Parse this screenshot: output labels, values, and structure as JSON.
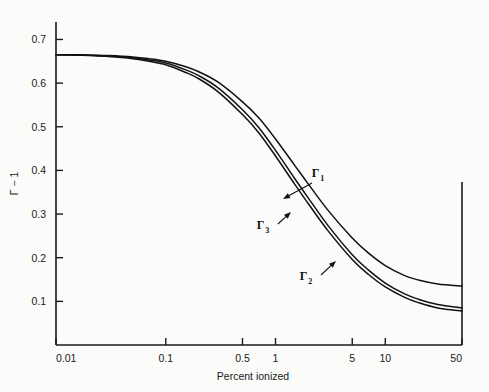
{
  "chart_data": {
    "type": "line",
    "title": "",
    "xlabel": "Percent ionized",
    "ylabel": "Γ − 1",
    "xscale": "log",
    "yscale": "linear",
    "xlim": [
      0.01,
      50
    ],
    "ylim": [
      0.0,
      0.74
    ],
    "grid": false,
    "legend_position": "inline-annotations",
    "xticks": [
      {
        "value": 0.01,
        "label": "0.01"
      },
      {
        "value": 0.1,
        "label": "0.1"
      },
      {
        "value": 0.5,
        "label": "0.5"
      },
      {
        "value": 1,
        "label": "1"
      },
      {
        "value": 5,
        "label": "5"
      },
      {
        "value": 10,
        "label": "10"
      },
      {
        "value": 50,
        "label": "50"
      }
    ],
    "yticks": [
      {
        "value": 0.1,
        "label": "0.1"
      },
      {
        "value": 0.2,
        "label": "0.2"
      },
      {
        "value": 0.3,
        "label": "0.3"
      },
      {
        "value": 0.4,
        "label": "0.4"
      },
      {
        "value": 0.5,
        "label": "0.5"
      },
      {
        "value": 0.6,
        "label": "0.6"
      },
      {
        "value": 0.7,
        "label": "0.7"
      }
    ],
    "series": [
      {
        "name": "Γ₁",
        "label_base": "Γ",
        "label_sub": "1",
        "x": [
          0.01,
          0.015,
          0.02,
          0.03,
          0.05,
          0.07,
          0.1,
          0.15,
          0.2,
          0.3,
          0.5,
          0.7,
          1.0,
          1.5,
          2.0,
          3.0,
          5.0,
          7.0,
          10.0,
          15.0,
          20.0,
          30.0,
          50.0
        ],
        "y": [
          0.665,
          0.665,
          0.664,
          0.663,
          0.66,
          0.656,
          0.65,
          0.638,
          0.626,
          0.602,
          0.557,
          0.521,
          0.472,
          0.411,
          0.368,
          0.309,
          0.245,
          0.211,
          0.182,
          0.159,
          0.149,
          0.14,
          0.135
        ]
      },
      {
        "name": "Γ₃",
        "label_base": "Γ",
        "label_sub": "3",
        "x": [
          0.01,
          0.015,
          0.02,
          0.03,
          0.05,
          0.07,
          0.1,
          0.15,
          0.2,
          0.3,
          0.5,
          0.7,
          1.0,
          1.5,
          2.0,
          3.0,
          5.0,
          7.0,
          10.0,
          15.0,
          20.0,
          30.0,
          50.0
        ],
        "y": [
          0.665,
          0.665,
          0.664,
          0.662,
          0.658,
          0.653,
          0.646,
          0.631,
          0.617,
          0.589,
          0.539,
          0.499,
          0.446,
          0.381,
          0.336,
          0.274,
          0.207,
          0.172,
          0.142,
          0.117,
          0.105,
          0.093,
          0.085
        ]
      },
      {
        "name": "Γ₂",
        "label_base": "Γ",
        "label_sub": "2",
        "x": [
          0.01,
          0.015,
          0.02,
          0.03,
          0.05,
          0.07,
          0.1,
          0.15,
          0.2,
          0.3,
          0.5,
          0.7,
          1.0,
          1.5,
          2.0,
          3.0,
          5.0,
          7.0,
          10.0,
          15.0,
          20.0,
          30.0,
          50.0
        ],
        "y": [
          0.665,
          0.664,
          0.663,
          0.661,
          0.656,
          0.65,
          0.642,
          0.625,
          0.61,
          0.58,
          0.528,
          0.487,
          0.433,
          0.368,
          0.323,
          0.262,
          0.196,
          0.162,
          0.133,
          0.109,
          0.097,
          0.085,
          0.078
        ]
      }
    ],
    "annotations": [
      {
        "name": "gamma-1",
        "text_base": "Γ",
        "text_sub": "1",
        "label_x": 318,
        "label_y": 177,
        "arrow_from_x": 312,
        "arrow_from_y": 183,
        "arrow_to_x": 283,
        "arrow_to_y": 199
      },
      {
        "name": "gamma-3",
        "text_base": "Γ",
        "text_sub": "3",
        "label_x": 263,
        "label_y": 229,
        "arrow_from_x": 278,
        "arrow_from_y": 224,
        "arrow_to_x": 291,
        "arrow_to_y": 212
      },
      {
        "name": "gamma-2",
        "text_base": "Γ",
        "text_sub": "2",
        "label_x": 306,
        "label_y": 280,
        "arrow_from_x": 321,
        "arrow_from_y": 275,
        "arrow_to_x": 336,
        "arrow_to_y": 261
      }
    ],
    "colors": {
      "curve": "#111111",
      "axis": "#1a1a1a",
      "background": "#fbfbfa"
    }
  }
}
